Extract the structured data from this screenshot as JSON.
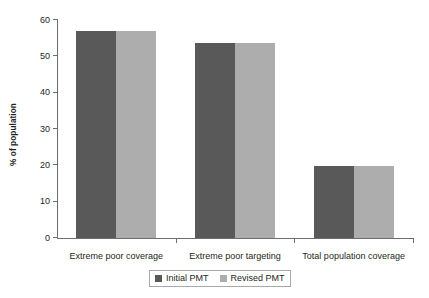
{
  "chart_data": {
    "type": "bar",
    "title": "",
    "xlabel": "",
    "ylabel": "% of population",
    "ylim": [
      0,
      60
    ],
    "yticks": [
      0,
      10,
      20,
      30,
      40,
      50,
      60
    ],
    "ytick_labels": [
      "0",
      "10",
      "20",
      "30",
      "40",
      "50",
      "60"
    ],
    "grid": false,
    "legend_position": "bottom-center",
    "categories": [
      "Extreme poor coverage",
      "Extreme poor targeting",
      "Total population coverage"
    ],
    "series": [
      {
        "name": "Initial PMT",
        "color": "#595959",
        "values": [
          57.0,
          53.7,
          19.7
        ]
      },
      {
        "name": "Revised PMT",
        "color": "#adadad",
        "values": [
          57.0,
          53.7,
          19.7
        ]
      }
    ]
  },
  "axis": {
    "y_title": "% of population"
  },
  "legend": {
    "entries": [
      {
        "label": "Initial PMT",
        "color": "#595959"
      },
      {
        "label": "Revised PMT",
        "color": "#adadad"
      }
    ]
  }
}
